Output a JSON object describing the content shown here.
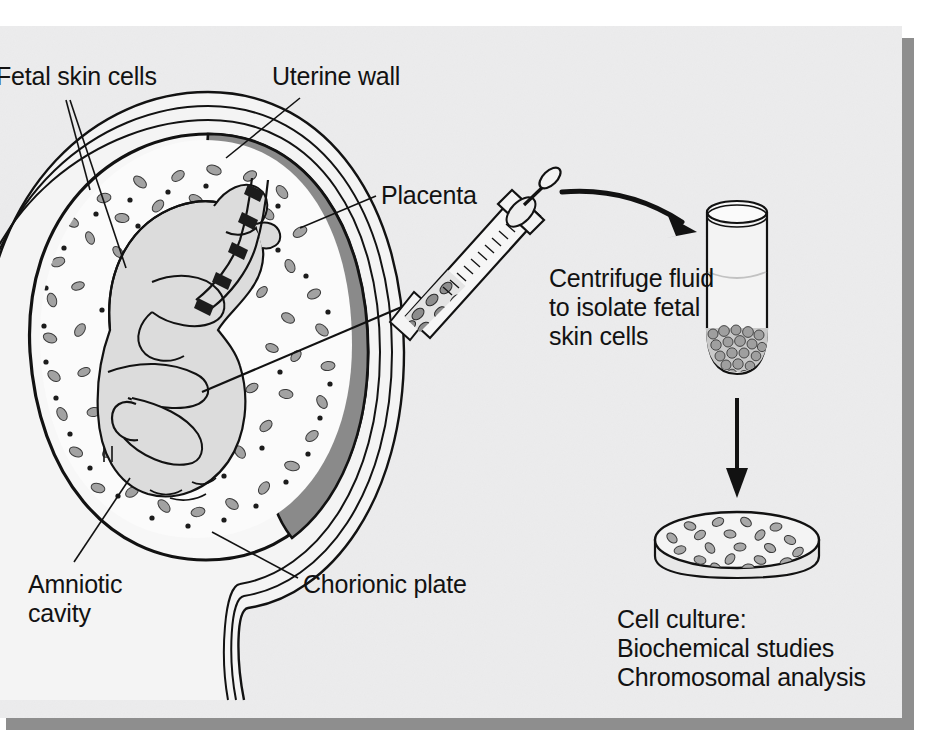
{
  "figure": {
    "background_color": "#ececed",
    "shadow_color": "#8e8e8e",
    "ink_color": "#121212",
    "placenta_fill": "#8a8a8a",
    "uterine_wall_fill": "#f2f2f2",
    "amniotic_fluid_fill": "#fafafa",
    "fetus_fill": "#dcdcdc",
    "cell_fill": "#9a9a9a"
  },
  "labels": {
    "fetal_skin_cells": "Fetal skin cells",
    "uterine_wall": "Uterine wall",
    "placenta": "Placenta",
    "amniotic_cavity": "Amniotic\ncavity",
    "chorionic_plate": "Chorionic plate",
    "centrifuge_note": "Centrifuge fluid\nto isolate fetal\nskin cells",
    "cell_culture_note": "Cell culture:\nBiochemical studies\nChromosomal analysis"
  },
  "elements": {
    "syringe": "syringe-with-needle",
    "test_tube": "centrifuge-test-tube",
    "petri_dish": "petri-dish-with-cells",
    "curved_arrow": "curved-arrow-syringe-to-tube",
    "straight_arrow": "down-arrow-tube-to-dish"
  }
}
